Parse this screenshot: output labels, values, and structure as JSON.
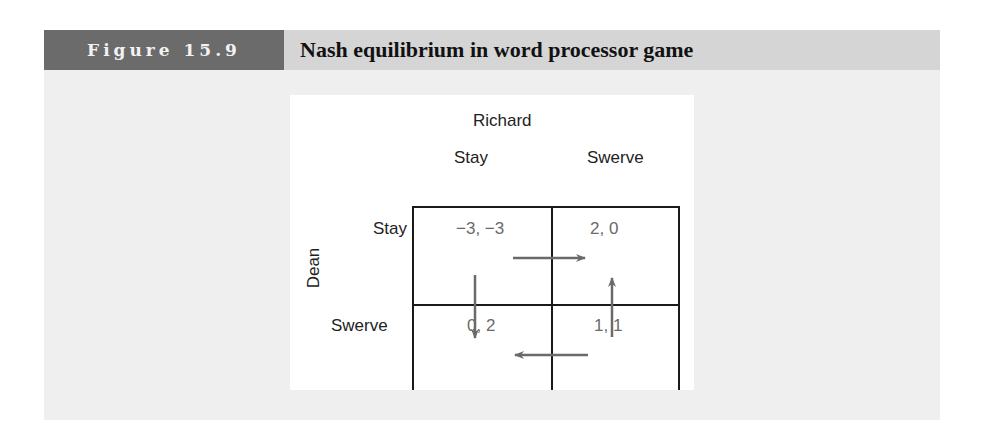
{
  "figure": {
    "label": "Figure 15.9",
    "title": "Nash equilibrium in word processor game"
  },
  "game": {
    "column_player": "Richard",
    "row_player": "Dean",
    "column_strategies": [
      "Stay",
      "Swerve"
    ],
    "row_strategies": [
      "Stay",
      "Swerve"
    ],
    "payoffs": [
      [
        "−3, −3",
        "2, 0"
      ],
      [
        "0, 2",
        "1, 1"
      ]
    ],
    "arrows": [
      {
        "from": "Stay,Stay",
        "to": "Stay,Swerve",
        "direction": "right"
      },
      {
        "from": "Stay,Stay",
        "to": "Swerve,Stay",
        "direction": "down"
      },
      {
        "from": "Swerve,Swerve",
        "to": "Stay,Swerve",
        "direction": "up"
      },
      {
        "from": "Swerve,Swerve",
        "to": "Swerve,Stay",
        "direction": "left"
      }
    ]
  },
  "colors": {
    "label_bg": "#6b6b6b",
    "header_bg": "#d5d5d5",
    "body_bg": "#efefef",
    "arrow": "#6a6a6a",
    "grid": "#1a1a1a"
  }
}
